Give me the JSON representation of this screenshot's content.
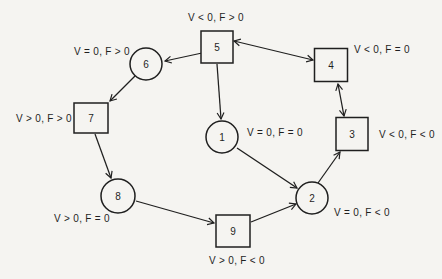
{
  "diagram": {
    "ink_color": "#1f1f1f",
    "paper_color": "#f5f4f1",
    "nodes": [
      {
        "id": "5",
        "shape": "square",
        "x": 217,
        "y": 47,
        "w": 32,
        "h": 32,
        "label": "5"
      },
      {
        "id": "6",
        "shape": "circle",
        "x": 146,
        "y": 64,
        "r": 16,
        "label": "6"
      },
      {
        "id": "4",
        "shape": "square",
        "x": 331,
        "y": 65,
        "w": 33,
        "h": 33,
        "label": "4"
      },
      {
        "id": "7",
        "shape": "square",
        "x": 91,
        "y": 118,
        "w": 34,
        "h": 30,
        "label": "7"
      },
      {
        "id": "3",
        "shape": "square",
        "x": 352,
        "y": 134,
        "w": 32,
        "h": 33,
        "label": "3"
      },
      {
        "id": "1",
        "shape": "circle",
        "x": 222,
        "y": 137,
        "r": 16,
        "label": "1"
      },
      {
        "id": "8",
        "shape": "circle",
        "x": 118,
        "y": 196,
        "r": 17,
        "label": "8"
      },
      {
        "id": "2",
        "shape": "circle",
        "x": 312,
        "y": 198,
        "r": 16,
        "label": "2"
      },
      {
        "id": "9",
        "shape": "square",
        "x": 233,
        "y": 231,
        "w": 34,
        "h": 32,
        "label": "9"
      }
    ],
    "edges": [
      {
        "from": "5",
        "to": "6",
        "x1": 202,
        "y1": 53,
        "x2": 165,
        "y2": 61,
        "double": false
      },
      {
        "from": "5",
        "to": "4",
        "x1": 234,
        "y1": 41,
        "x2": 313,
        "y2": 60,
        "double": true
      },
      {
        "from": "5",
        "to": "1",
        "x1": 217,
        "y1": 64,
        "x2": 221,
        "y2": 119,
        "double": false
      },
      {
        "from": "6",
        "to": "7",
        "x1": 135,
        "y1": 76,
        "x2": 110,
        "y2": 101,
        "double": false
      },
      {
        "from": "7",
        "to": "8",
        "x1": 95,
        "y1": 134,
        "x2": 111,
        "y2": 178,
        "double": false
      },
      {
        "from": "8",
        "to": "9",
        "x1": 136,
        "y1": 201,
        "x2": 214,
        "y2": 223,
        "double": false
      },
      {
        "from": "9",
        "to": "2",
        "x1": 251,
        "y1": 222,
        "x2": 296,
        "y2": 204,
        "double": false
      },
      {
        "from": "1",
        "to": "2",
        "x1": 237,
        "y1": 148,
        "x2": 297,
        "y2": 188,
        "double": false
      },
      {
        "from": "2",
        "to": "3",
        "x1": 318,
        "y1": 183,
        "x2": 340,
        "y2": 152,
        "double": false
      },
      {
        "from": "3",
        "to": "4",
        "x1": 344,
        "y1": 116,
        "x2": 338,
        "y2": 84,
        "double": true
      }
    ],
    "annotations": [
      {
        "text": "V < 0, F > 0",
        "x": 216,
        "y": 21,
        "anchor": "middle"
      },
      {
        "text": "V = 0, F > 0",
        "x": 102,
        "y": 55,
        "anchor": "middle"
      },
      {
        "text": "V < 0, F = 0",
        "x": 354,
        "y": 53,
        "anchor": "start"
      },
      {
        "text": "V > 0, F > 0",
        "x": 44,
        "y": 122,
        "anchor": "middle"
      },
      {
        "text": "V < 0, F < 0",
        "x": 379,
        "y": 138,
        "anchor": "start"
      },
      {
        "text": "V = 0, F = 0",
        "x": 247,
        "y": 136,
        "anchor": "start"
      },
      {
        "text": "V = 0, F < 0",
        "x": 334,
        "y": 216,
        "anchor": "start"
      },
      {
        "text": "V > 0, F = 0",
        "x": 82,
        "y": 222,
        "anchor": "middle"
      },
      {
        "text": "V > 0, F < 0",
        "x": 237,
        "y": 264,
        "anchor": "middle"
      }
    ]
  }
}
